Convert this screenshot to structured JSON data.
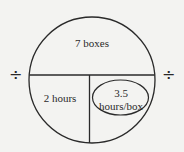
{
  "diagram": {
    "type": "division circle",
    "top_section": {
      "label": "7 boxes"
    },
    "bottom_left_section": {
      "label": "2 hours"
    },
    "bottom_right_section": {
      "line1": "3.5",
      "line2": "hours/box",
      "circled": true
    },
    "operators": {
      "left": "÷",
      "right": "÷"
    }
  },
  "colors": {
    "background": "#f3f3f1",
    "stroke": "#2a2a2a"
  }
}
